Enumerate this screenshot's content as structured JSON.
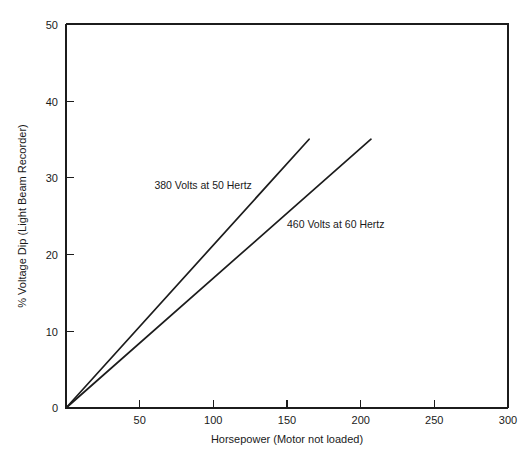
{
  "chart_data": {
    "type": "line",
    "title": "",
    "subtitle": "",
    "xlabel": "Horsepower (Motor not loaded)",
    "ylabel": "% Voltage Dip (Light Beam Recorder)",
    "xlim": [
      0,
      300
    ],
    "ylim": [
      0,
      50
    ],
    "grid": false,
    "legend_position": "inline-annotation",
    "x_ticks": [
      0,
      50,
      100,
      150,
      200,
      250,
      300
    ],
    "x_tick_labels": [
      "0",
      "50",
      "100",
      "150",
      "200",
      "250",
      "300"
    ],
    "y_ticks": [
      0,
      10,
      20,
      30,
      40,
      50
    ],
    "y_tick_labels": [
      "0",
      "10",
      "20",
      "30",
      "40",
      "50"
    ],
    "series": [
      {
        "name": "380 Volts at 50 Hertz",
        "x": [
          0,
          165
        ],
        "values": [
          0,
          35
        ],
        "annotation": "380 Volts at 50 Hertz",
        "annotation_x": 60,
        "annotation_y": 28.5
      },
      {
        "name": "460 Volts at 60 Hertz",
        "x": [
          0,
          207
        ],
        "values": [
          0,
          35
        ],
        "annotation": "460 Volts at 60 Hertz",
        "annotation_x": 150,
        "annotation_y": 23.5
      }
    ]
  },
  "axis": {
    "x_title": "Horsepower (Motor not loaded)",
    "y_title": "% Voltage Dip (Light Beam Recorder)"
  },
  "annotations": {
    "series_1": "380 Volts at 50 Hertz",
    "series_2": "460 Volts at 60 Hertz"
  },
  "colors": {
    "line": "#1c1c1c",
    "axis": "#1c1c1c",
    "text": "#1a1a1a",
    "background": "#ffffff"
  }
}
